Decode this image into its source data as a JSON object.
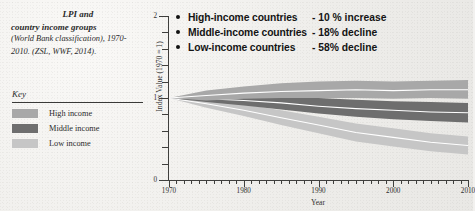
{
  "caption": {
    "line1": "LPI and",
    "line2": "country income groups",
    "line3": "(World Bank classification), 1970-2010. (ZSL, WWF, 2014)."
  },
  "key": {
    "title": "Key",
    "items": [
      {
        "label": "High income",
        "color": "#a8a8a8"
      },
      {
        "label": "Middle income",
        "color": "#6e6e6e"
      },
      {
        "label": "Low income",
        "color": "#c6c6c6"
      }
    ]
  },
  "callout": {
    "bullet_icon": "bullet-dot",
    "rows": [
      {
        "group": "High-income countries",
        "value": "- 10 % increase"
      },
      {
        "group": "Middle-income countries",
        "value": "- 18% decline"
      },
      {
        "group": "Low-income countries",
        "value": "- 58% decline"
      }
    ]
  },
  "chart_data": {
    "type": "area",
    "title": "LPI and country income groups",
    "xlabel": "Year",
    "ylabel": "Index Value (1970 = 1)",
    "xlim": [
      1970,
      2010
    ],
    "ylim": [
      0,
      2
    ],
    "yticks": [
      "0",
      "1",
      "2"
    ],
    "xticks": [
      "1970",
      "1980",
      "1990",
      "2000",
      "2010"
    ],
    "grid": false,
    "legend_position": "external-left",
    "x": [
      1970,
      1975,
      1980,
      1985,
      1990,
      1995,
      2000,
      2005,
      2010
    ],
    "series": [
      {
        "name": "High income",
        "color": "#a8a8a8",
        "values": [
          1.0,
          1.03,
          1.06,
          1.08,
          1.09,
          1.1,
          1.09,
          1.1,
          1.1
        ],
        "upper": [
          1.0,
          1.09,
          1.14,
          1.18,
          1.2,
          1.21,
          1.2,
          1.21,
          1.22
        ],
        "lower": [
          1.0,
          0.97,
          0.99,
          1.0,
          1.0,
          1.0,
          0.99,
          1.0,
          0.99
        ]
      },
      {
        "name": "Middle income",
        "color": "#6e6e6e",
        "values": [
          1.0,
          0.99,
          0.97,
          0.94,
          0.9,
          0.87,
          0.85,
          0.83,
          0.82
        ],
        "upper": [
          1.0,
          1.03,
          1.03,
          1.02,
          1.0,
          0.98,
          0.96,
          0.95,
          0.94
        ],
        "lower": [
          1.0,
          0.95,
          0.91,
          0.86,
          0.81,
          0.77,
          0.74,
          0.72,
          0.7
        ]
      },
      {
        "name": "Low income",
        "color": "#c6c6c6",
        "values": [
          1.0,
          0.93,
          0.85,
          0.76,
          0.67,
          0.58,
          0.52,
          0.46,
          0.42
        ],
        "upper": [
          1.0,
          0.98,
          0.92,
          0.85,
          0.77,
          0.69,
          0.63,
          0.57,
          0.53
        ],
        "lower": [
          1.0,
          0.88,
          0.78,
          0.67,
          0.57,
          0.47,
          0.41,
          0.35,
          0.31
        ]
      }
    ]
  }
}
